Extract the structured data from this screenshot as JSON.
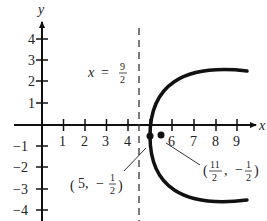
{
  "diagram": {
    "axes": {
      "x_label": "x",
      "y_label": "y",
      "x_ticks": [
        "1",
        "2",
        "3",
        "4",
        "5",
        "6",
        "7",
        "8",
        "9"
      ],
      "x_tick_labels_shown": [
        "1",
        "2",
        "3",
        "4",
        "6",
        "7",
        "8",
        "9"
      ],
      "y_ticks_positive": [
        "1",
        "2",
        "3",
        "4"
      ],
      "y_ticks_negative": [
        "−1",
        "−2",
        "−3",
        "−4"
      ]
    },
    "directrix": {
      "label_var": "x",
      "label_eq": "=",
      "num": "9",
      "den": "2"
    },
    "vertex": {
      "open": "(",
      "x": "5,",
      "sign": "−",
      "num": "1",
      "den": "2",
      "close": ")"
    },
    "focus": {
      "open": "(",
      "xnum": "11",
      "xden": "2",
      "comma": ",",
      "sign": "−",
      "num": "1",
      "den": "2",
      "close": ")"
    },
    "colors": {
      "ink": "#111111",
      "text": "#222222"
    }
  }
}
